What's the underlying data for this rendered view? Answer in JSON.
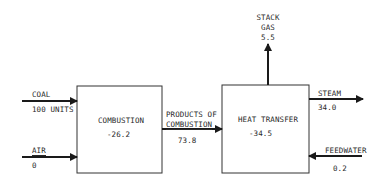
{
  "diagram": {
    "type": "energy-balance-flow",
    "blocks": [
      {
        "id": "combustion",
        "label": "COMBUSTION",
        "value": "-26.2"
      },
      {
        "id": "heat_transfer",
        "label": "HEAT TRANSFER",
        "value": "-34.5"
      }
    ],
    "flows": {
      "coal": {
        "label": "COAL",
        "value": "100 UNITS"
      },
      "air": {
        "label": "AIR",
        "value": "0"
      },
      "products": {
        "label_line1": "PRODUCTS OF",
        "label_line2": "COMBUSTION",
        "value": "73.8"
      },
      "stack_gas": {
        "label_line1": "STACK",
        "label_line2": "GAS",
        "value": "5.5"
      },
      "steam": {
        "label": "STEAM",
        "value": "34.0"
      },
      "feedwater": {
        "label": "FEEDWATER",
        "value": "0.2"
      }
    },
    "colors": {
      "line": "#1a1a1a",
      "text": "#2a2a2a",
      "background": "#ffffff"
    }
  }
}
